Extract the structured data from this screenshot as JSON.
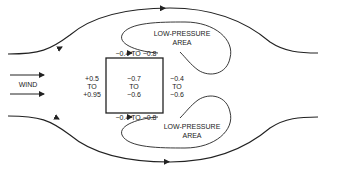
{
  "diagram": {
    "wind_label": "WIND",
    "low_pressure_top": {
      "line1": "LOW-PRESSURE",
      "line2": "AREA"
    },
    "low_pressure_bottom": {
      "line1": "LOW-PRESSURE",
      "line2": "AREA"
    },
    "windward": {
      "line1": "+0.5",
      "line2": "TO",
      "line3": "+0.95"
    },
    "roof": {
      "line1": "−0.7",
      "line2": "TO",
      "line3": "−0.6"
    },
    "leeward": {
      "line1": "−0.4",
      "line2": "TO",
      "line3": "−0.6"
    },
    "side_top": "−0.4 TO −0.8",
    "side_bottom": "−0.4 TO −0.8",
    "colors": {
      "line": "#222222",
      "background": "#ffffff"
    }
  }
}
